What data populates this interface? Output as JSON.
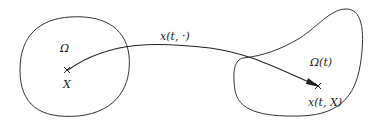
{
  "diagram": {
    "type": "flow-map-illustration",
    "reference_domain": {
      "label": "Ω",
      "point_label": "X",
      "point_marker": "cross"
    },
    "current_domain": {
      "label": "Ω(t)",
      "point_label": "x(t, X)",
      "point_marker": "cross"
    },
    "mapping": {
      "label": "x(t, ·)",
      "arrow": "curved arrow from X to x(t, X)"
    },
    "colors": {
      "stroke": "#333333",
      "background": "#ffffff"
    }
  }
}
